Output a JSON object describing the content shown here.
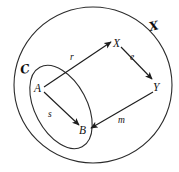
{
  "diagram": {
    "type": "commutative-diagram",
    "background_color": "#ffffff",
    "stroke_color": "#1d1d1d",
    "ambient": {
      "name": "outer-region",
      "label": "ℰ",
      "label_text": "X",
      "shape": "circle",
      "description": "Large outer circle enclosing the whole diagram"
    },
    "subcategory": {
      "name": "inner-region",
      "label": "ℭ",
      "label_text": "C",
      "shape": "tilted-ellipse",
      "description": "Small tilted ellipse at the lower-left, inside the outer circle"
    },
    "objects": [
      {
        "id": "A",
        "label": "A",
        "region": "inner",
        "x": 37,
        "y": 88
      },
      {
        "id": "B",
        "label": "B",
        "region": "inner",
        "x": 83,
        "y": 129
      },
      {
        "id": "X",
        "label": "X",
        "region": "outer",
        "x": 117,
        "y": 43
      },
      {
        "id": "Y",
        "label": "Y",
        "region": "outer",
        "x": 157,
        "y": 86
      }
    ],
    "morphisms": [
      {
        "id": "r",
        "label": "r",
        "from": "A",
        "to": "X",
        "label_x": 73,
        "label_y": 57
      },
      {
        "id": "e",
        "label": "e",
        "from": "X",
        "to": "Y",
        "label_x": 133,
        "label_y": 57
      },
      {
        "id": "m",
        "label": "m",
        "from": "Y",
        "to": "B",
        "label_x": 122,
        "label_y": 120
      },
      {
        "id": "s",
        "label": "s",
        "from": "A",
        "to": "B",
        "label_x": 51,
        "label_y": 114
      }
    ],
    "region_labels": [
      {
        "id": "outer",
        "label": "X",
        "x": 154,
        "y": 27,
        "style": "script"
      },
      {
        "id": "inner",
        "label": "C",
        "x": 25,
        "y": 70,
        "style": "script"
      }
    ]
  }
}
